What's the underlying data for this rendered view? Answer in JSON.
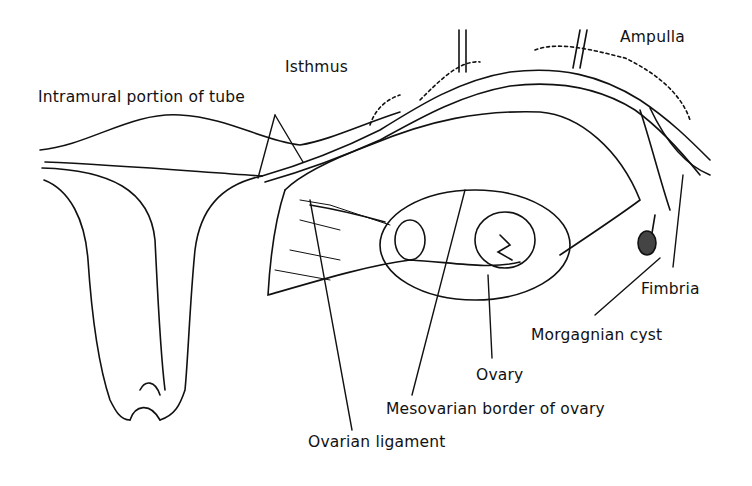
{
  "figure": {
    "line_color": "#111111",
    "background": "#ffffff",
    "labels": {
      "isthmus": "Isthmus",
      "ampulla": "Ampulla",
      "intramural": "Intramural portion of tube",
      "fimbria": "Fimbria",
      "morgagnian_cyst": "Morgagnian cyst",
      "ovary": "Ovary",
      "mesovarian_border": "Mesovarian border of ovary",
      "ovarian_ligament": "Ovarian ligament"
    }
  }
}
